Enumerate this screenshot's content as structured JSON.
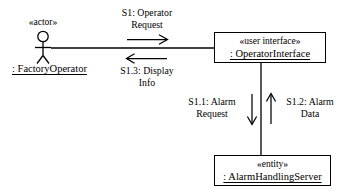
{
  "diagram": {
    "type": "uml-communication-diagram",
    "background_color": "#ffffff",
    "line_color": "#000000",
    "actor": {
      "stereotype": "«actor»",
      "name": ": FactoryOperator",
      "icon": "stick-figure-actor-icon"
    },
    "nodes": [
      {
        "id": "operator-interface",
        "stereotype": "«user interface»",
        "name": ": OperatorInterface"
      },
      {
        "id": "alarm-handling-server",
        "stereotype": "«entity»",
        "name": ": AlarmHandlingServer"
      }
    ],
    "messages": [
      {
        "id": "s1",
        "label": "S1: Operator\nRequest",
        "direction": "right",
        "from": "actor",
        "to": "operator-interface"
      },
      {
        "id": "s1-3",
        "label": "S1.3: Display\nInfo",
        "direction": "left",
        "from": "operator-interface",
        "to": "actor"
      },
      {
        "id": "s1-1",
        "label": "S1.1: Alarm\nRequest",
        "direction": "down",
        "from": "operator-interface",
        "to": "alarm-handling-server"
      },
      {
        "id": "s1-2",
        "label": "S1.2: Alarm\nData",
        "direction": "up",
        "from": "alarm-handling-server",
        "to": "operator-interface"
      }
    ]
  }
}
